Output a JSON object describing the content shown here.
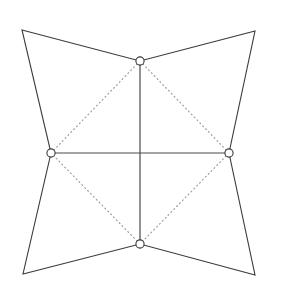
{
  "figure": {
    "background_color": "#ffffff",
    "width": 290,
    "height": 288
  },
  "style": {
    "outline_color": "#3b3b3b",
    "outline_width": 1.1,
    "axis_color": "#4a4a4a",
    "axis_width": 1.2,
    "dotted_color": "#9a9a9a",
    "dotted_width": 1.15,
    "dotted_dasharray": "1 3.1",
    "node_fill": "#ffffff",
    "node_stroke": "#3a3a3a",
    "node_radius": 4.1
  },
  "chart_data": {
    "type": "scatter",
    "xlabel": "",
    "ylabel": "",
    "grid": false,
    "legend": "none",
    "xlim": [
      0,
      290
    ],
    "ylim": [
      0,
      288
    ],
    "corners": [
      {
        "name": "top-left-corner",
        "x": 22,
        "y": 30
      },
      {
        "name": "top-right-corner",
        "x": 255,
        "y": 31
      },
      {
        "name": "bottom-right-corner",
        "x": 255,
        "y": 275
      },
      {
        "name": "bottom-left-corner",
        "x": 23,
        "y": 274
      }
    ],
    "nodes": [
      {
        "name": "top-node",
        "x": 140,
        "y": 61
      },
      {
        "name": "right-node",
        "x": 229,
        "y": 153
      },
      {
        "name": "bottom-node",
        "x": 140,
        "y": 244
      },
      {
        "name": "left-node",
        "x": 51,
        "y": 153
      }
    ],
    "center": {
      "name": "center-point",
      "x": 140,
      "y": 153
    },
    "outline_polygon": "22,30 140,61 255,31 229,153 255,275 140,244 23,274 51,153",
    "solid_segments": [
      {
        "name": "vertical-axis",
        "x1": 140,
        "y1": 61,
        "x2": 140,
        "y2": 244
      },
      {
        "name": "horizontal-axis",
        "x1": 51,
        "y1": 153,
        "x2": 229,
        "y2": 153
      }
    ],
    "dotted_segments": [
      {
        "name": "dotted-top-left",
        "x1": 140,
        "y1": 61,
        "x2": 51,
        "y2": 153
      },
      {
        "name": "dotted-top-right",
        "x1": 140,
        "y1": 61,
        "x2": 229,
        "y2": 153
      },
      {
        "name": "dotted-bottom-right",
        "x1": 229,
        "y1": 153,
        "x2": 140,
        "y2": 244
      },
      {
        "name": "dotted-bottom-left",
        "x1": 140,
        "y1": 244,
        "x2": 51,
        "y2": 153
      }
    ]
  }
}
